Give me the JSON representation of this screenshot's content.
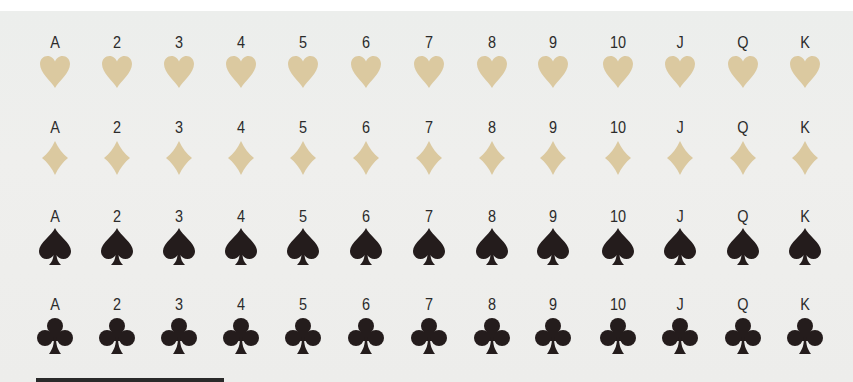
{
  "ranks": [
    "A",
    "2",
    "3",
    "4",
    "5",
    "6",
    "7",
    "8",
    "9",
    "10",
    "J",
    "Q",
    "K"
  ],
  "colors": {
    "background": "#eeeeec",
    "light_suit": "#dbc9a0",
    "dark_suit": "#241c1c",
    "label_text": "#2b2b2b"
  },
  "rows": [
    {
      "suit": "hearts",
      "icon": "heart-icon",
      "color": "#dbc9a0",
      "ranks": [
        "A",
        "2",
        "3",
        "4",
        "5",
        "6",
        "7",
        "8",
        "9",
        "10",
        "J",
        "Q",
        "K"
      ]
    },
    {
      "suit": "diamonds",
      "icon": "diamond-icon",
      "color": "#dbc9a0",
      "ranks": [
        "A",
        "2",
        "3",
        "4",
        "5",
        "6",
        "7",
        "8",
        "9",
        "10",
        "J",
        "Q",
        "K"
      ]
    },
    {
      "suit": "spades",
      "icon": "spade-icon",
      "color": "#241c1c",
      "ranks": [
        "A",
        "2",
        "3",
        "4",
        "5",
        "6",
        "7",
        "8",
        "9",
        "10",
        "J",
        "Q",
        "K"
      ]
    },
    {
      "suit": "clubs",
      "icon": "club-icon",
      "color": "#241c1c",
      "ranks": [
        "A",
        "2",
        "3",
        "4",
        "5",
        "6",
        "7",
        "8",
        "9",
        "10",
        "J",
        "Q",
        "K"
      ]
    }
  ]
}
